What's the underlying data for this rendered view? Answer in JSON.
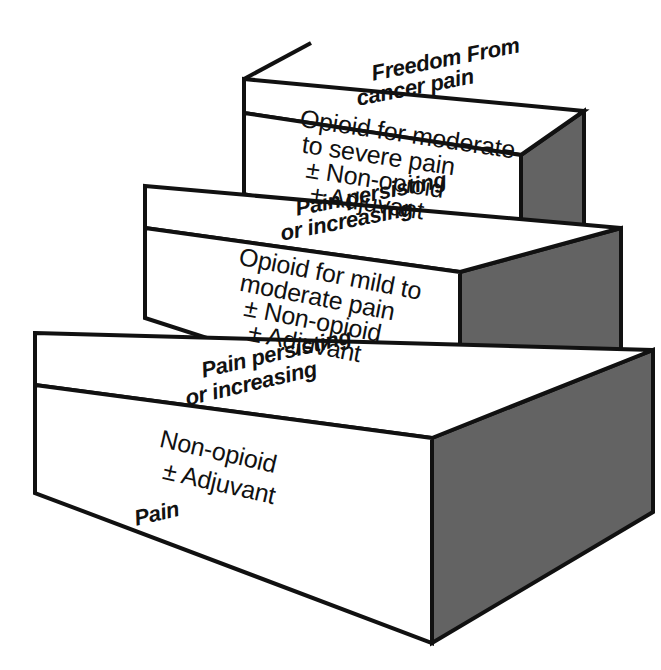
{
  "figure": {
    "name": "WHO three-step analgesic ladder",
    "type": "stepped-3d-diagram",
    "background_color": "#ffffff",
    "ink_color": "#111111",
    "side_face_color": "#636363",
    "top_face_color": "#ffffff",
    "front_face_color": "#ffffff"
  },
  "steps": [
    {
      "index": 1,
      "position": "bottom",
      "front_lines": [
        "Non-opioid",
        "± Adjuvant"
      ],
      "top_lines": [
        "Pain persisting",
        "or increasing"
      ],
      "entry_label": "Pain"
    },
    {
      "index": 2,
      "position": "middle",
      "front_lines": [
        "Opioid for mild to",
        "moderate pain",
        "± Non-opioid",
        "± Adjuvant"
      ],
      "top_lines": [
        "Pain persisting",
        "or increasing"
      ],
      "entry_label": ""
    },
    {
      "index": 3,
      "position": "top",
      "front_lines": [
        "Opioid for moderate",
        "to severe pain",
        "± Non-opioid",
        "± Adjuvant"
      ],
      "top_lines": [
        "Freedom From",
        "cancer pain"
      ],
      "entry_label": ""
    }
  ],
  "labels": {
    "step1_front_l1": "Non-opioid",
    "step1_front_l2": "± Adjuvant",
    "step1_top_l1": "Pain persisting",
    "step1_top_l2": "or increasing",
    "step1_entry": "Pain",
    "step2_front_l1": "Opioid for mild to",
    "step2_front_l2": "moderate pain",
    "step2_front_l3": "± Non-opioid",
    "step2_front_l4": "± Adjuvant",
    "step2_top_l1": "Pain persisting",
    "step2_top_l2": "or increasing",
    "step3_front_l1": "Opioid for moderate",
    "step3_front_l2": "to severe pain",
    "step3_front_l3": "± Non-opioid",
    "step3_front_l4": "± Adjuvant",
    "step3_top_l1": "Freedom From",
    "step3_top_l2": "cancer pain"
  }
}
